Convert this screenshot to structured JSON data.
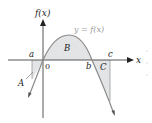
{
  "figure": {
    "y_axis_label": "f(x)",
    "x_axis_label": "x",
    "curve_label": "y = f(x)",
    "origin_label": "0",
    "points": {
      "a": "a",
      "b": "b",
      "c": "c"
    },
    "regions": {
      "A": "A",
      "B": "B",
      "C": "C"
    },
    "colors": {
      "curve": "#8a8a8a",
      "axis": "#333333",
      "shade": "#e2e4e6",
      "text": "#222222",
      "curve_label": "#9a9a9a"
    }
  }
}
